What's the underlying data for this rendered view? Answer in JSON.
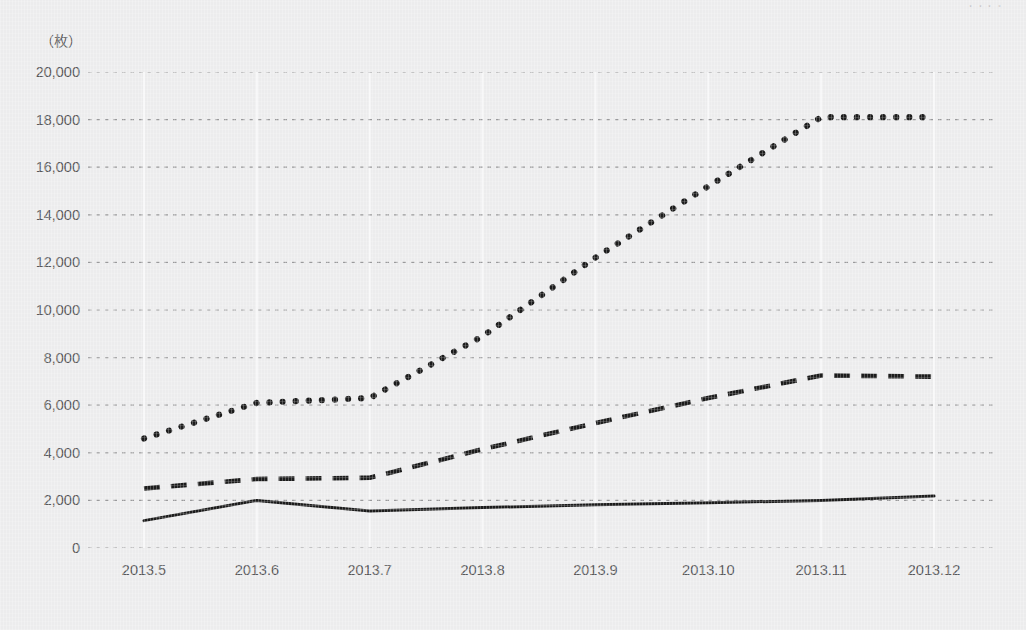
{
  "chart_data": {
    "type": "line",
    "title": "",
    "subtitle": "",
    "xlabel": "",
    "ylabel": "（枚）",
    "unit_caption": "（枚）",
    "categories": [
      "2013.5",
      "2013.6",
      "2013.7",
      "2013.8",
      "2013.9",
      "2013.10",
      "2013.11",
      "2013.12"
    ],
    "x": [
      2013.5,
      2013.6,
      2013.7,
      2013.8,
      2013.9,
      2013.1,
      2013.11,
      2013.12
    ],
    "ylim": [
      0,
      20000
    ],
    "ytick_values": [
      0,
      2000,
      4000,
      6000,
      8000,
      10000,
      12000,
      14000,
      16000,
      18000,
      20000
    ],
    "ytick_labels": [
      "0",
      "2,000",
      "4,000",
      "6,000",
      "8,000",
      "10,000",
      "12,000",
      "14,000",
      "16,000",
      "18,000",
      "20,000"
    ],
    "grid": {
      "horizontal": true,
      "horizontal_style": "dotted",
      "vertical": true,
      "vertical_style": "solid-white"
    },
    "legend": {
      "visible": false,
      "position": "none"
    },
    "series": [
      {
        "name": "series-dotted",
        "style": "dotted",
        "color": "#1c1c1c",
        "values": [
          4600,
          6100,
          6300,
          8900,
          12200,
          15200,
          18100,
          18100
        ]
      },
      {
        "name": "series-dashed",
        "style": "dashed",
        "color": "#1c1c1c",
        "values": [
          2500,
          2900,
          2950,
          4150,
          5250,
          6300,
          7250,
          7200
        ]
      },
      {
        "name": "series-solid",
        "style": "solid",
        "color": "#1c1c1c",
        "values": [
          1150,
          2000,
          1550,
          1700,
          1820,
          1900,
          2000,
          2180
        ]
      }
    ]
  },
  "top_edge_artifact": "・・・・"
}
